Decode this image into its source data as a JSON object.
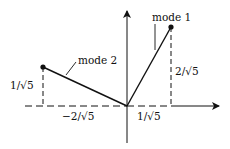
{
  "diagram": {
    "type": "vector mode shapes",
    "axes": {
      "origin": [
        0,
        0
      ],
      "x_arrow": true,
      "y_arrow": true
    },
    "modes": [
      {
        "name": "mode 1",
        "label": "mode 1",
        "vector": [
          "1/√5",
          "2/√5"
        ],
        "point": [
          0.447,
          0.894
        ]
      },
      {
        "name": "mode 2",
        "label": "mode 2",
        "vector": [
          "-2/√5",
          "1/√5"
        ],
        "point": [
          -0.894,
          0.447
        ]
      }
    ],
    "labels": {
      "mode1": "mode 1",
      "mode2": "mode 2",
      "mode1_x": "1/√5",
      "mode1_y": "2/√5",
      "mode2_x": "−2/√5",
      "mode2_y": "1/√5"
    },
    "colors": {
      "line": "#111111",
      "background": "#ffffff"
    }
  }
}
